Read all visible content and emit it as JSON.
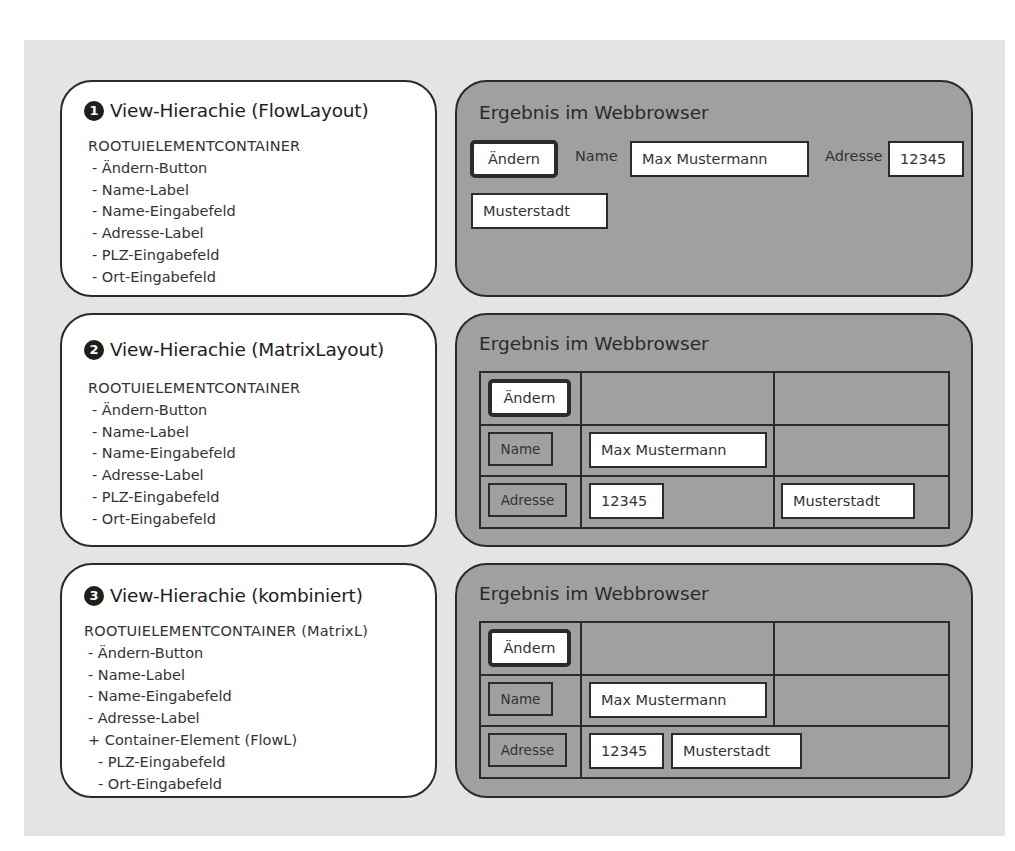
{
  "panels": [
    {
      "number": "1",
      "hierarchy_title": "View-Hierachie (FlowLayout)",
      "root": "ROOTUIELEMENTCONTAINER",
      "items": [
        "- Ändern-Button",
        "- Name-Label",
        "- Name-Eingabefeld",
        "- Adresse-Label",
        "- PLZ-Eingabefeld",
        "- Ort-Eingabefeld"
      ],
      "result_title": "Ergebnis im Webbrowser",
      "result": {
        "button": "Ändern",
        "name_label": "Name",
        "name_value": "Max Mustermann",
        "address_label": "Adresse",
        "zip_value": "12345",
        "city_value": "Musterstadt"
      }
    },
    {
      "number": "2",
      "hierarchy_title": "View-Hierachie (MatrixLayout)",
      "root": "ROOTUIELEMENTCONTAINER",
      "items": [
        "- Ändern-Button",
        "- Name-Label",
        "- Name-Eingabefeld",
        "- Adresse-Label",
        "- PLZ-Eingabefeld",
        "- Ort-Eingabefeld"
      ],
      "result_title": "Ergebnis im Webbrowser",
      "result": {
        "button": "Ändern",
        "name_label": "Name",
        "name_value": "Max Mustermann",
        "address_label": "Adresse",
        "zip_value": "12345",
        "city_value": "Musterstadt"
      }
    },
    {
      "number": "3",
      "hierarchy_title": "View-Hierachie (kombiniert)",
      "root": "ROOTUIELEMENTCONTAINER (MatrixL)",
      "items": [
        "- Ändern-Button",
        "- Name-Label",
        "- Name-Eingabefeld",
        "- Adresse-Label",
        "+ Container-Element (FlowL)",
        "- PLZ-Eingabefeld",
        "- Ort-Eingabefeld"
      ],
      "result_title": "Ergebnis im Webbrowser",
      "result": {
        "button": "Ändern",
        "name_label": "Name",
        "name_value": "Max Mustermann",
        "address_label": "Adresse",
        "zip_value": "12345",
        "city_value": "Musterstadt"
      }
    }
  ],
  "colors": {
    "background": "#e4e4e4",
    "hierarchy_box": "#ffffff",
    "result_box": "#a0a0a0",
    "border": "#2a2a2a"
  }
}
